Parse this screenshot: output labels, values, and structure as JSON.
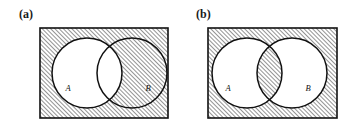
{
  "figure": {
    "background_color": "#ffffff",
    "stroke_color": "#111111",
    "hatch_color": "#3a3a3a",
    "hatch_spacing_px": 3,
    "hatch_direction": "forward-slash-diagonal"
  },
  "panels": [
    {
      "id": "a",
      "caption": "(a)",
      "rect": {
        "x": 40,
        "y": 28,
        "width": 128,
        "height": 90
      },
      "circles": [
        {
          "label": "A",
          "cx": 87,
          "cy": 73,
          "r": 35,
          "fill": "white",
          "label_x": 68,
          "label_y": 91
        },
        {
          "label": "B",
          "cx": 132,
          "cy": 73,
          "r": 35,
          "fill": "hatched",
          "label_x": 148,
          "label_y": 91
        }
      ],
      "shaded_description": "complement of A",
      "lens_shaded": false,
      "exterior_shaded": true
    },
    {
      "id": "b",
      "caption": "(b)",
      "rect": {
        "x": 31,
        "y": 28,
        "width": 129,
        "height": 90
      },
      "circles": [
        {
          "label": "A",
          "cx": 70,
          "cy": 73,
          "r": 35,
          "fill": "white",
          "label_x": 51,
          "label_y": 91
        },
        {
          "label": "B",
          "cx": 115,
          "cy": 73,
          "r": 35,
          "fill": "white",
          "label_x": 131,
          "label_y": 91
        }
      ],
      "shaded_description": "complement of symmetric difference: (A intersect B) union (A union B) complement",
      "lens_shaded": true,
      "exterior_shaded": true
    }
  ]
}
